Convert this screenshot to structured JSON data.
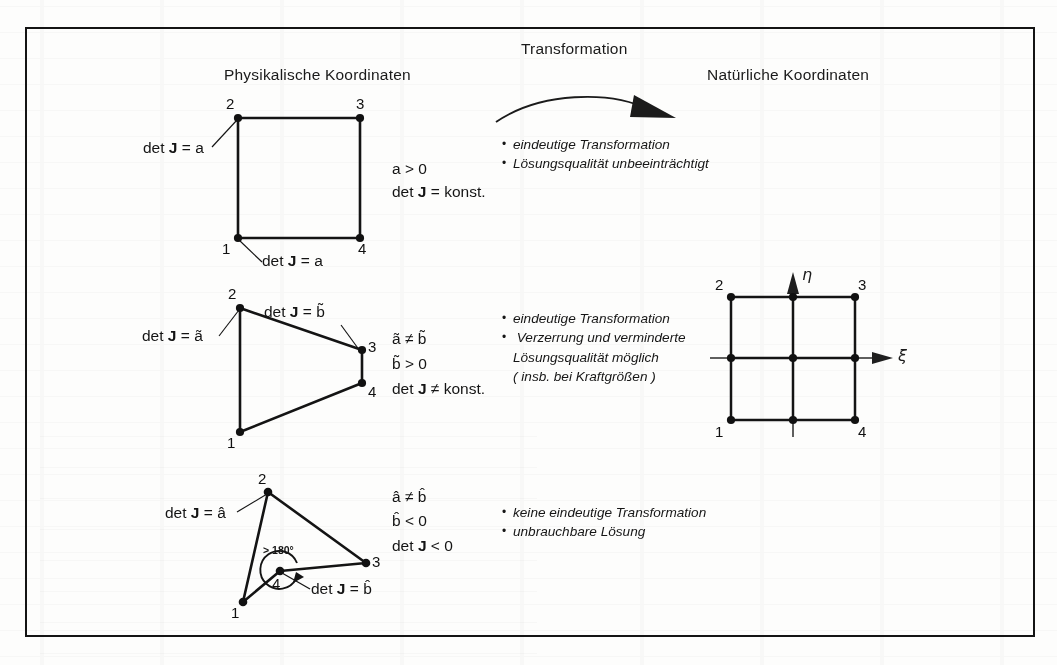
{
  "figure": {
    "headings": {
      "physical": "Physikalische Koordinaten",
      "transformation": "Transformation",
      "natural": "Natürliche Koordinaten"
    },
    "rows": [
      {
        "id": "square",
        "shape": "square",
        "node_labels": [
          "1",
          "2",
          "3",
          "4"
        ],
        "callouts": [
          {
            "text_prefix": "det ",
            "text_j": "J",
            "text_eq": " = a",
            "anchor": "node2"
          },
          {
            "text_prefix": "det ",
            "text_j": "J",
            "text_eq": " = a",
            "anchor": "node1"
          }
        ],
        "equations": [
          "a > 0",
          "det J = konst."
        ],
        "equation_parts": [
          {
            "lead": "a > 0",
            "j": "",
            "tail": ""
          },
          {
            "lead": "det ",
            "j": "J",
            "tail": " = konst."
          }
        ],
        "bullets": [
          "eindeutige Transformation",
          "Lösungsqualität unbeeinträchtigt"
        ]
      },
      {
        "id": "trapezoid",
        "shape": "trapezoid",
        "node_labels": [
          "1",
          "2",
          "3",
          "4"
        ],
        "callouts": [
          {
            "text_prefix": "det ",
            "text_j": "J",
            "text_eq": " = ã",
            "anchor": "node2"
          },
          {
            "text_prefix": "det ",
            "text_j": "J",
            "text_eq": " = b̃",
            "anchor": "node3"
          }
        ],
        "equations": [
          "ã ≠ b̃",
          "b̃ > 0",
          "det J ≠ konst."
        ],
        "bullets": [
          "eindeutige Transformation",
          "Verzerrung und verminderte",
          "Lösungsqualität möglich",
          "( insb. bei Kraftgrößen )"
        ]
      },
      {
        "id": "concave",
        "shape": "concave-quad",
        "node_labels": [
          "1",
          "2",
          "3",
          "4"
        ],
        "callouts": [
          {
            "text_prefix": "det ",
            "text_j": "J",
            "text_eq": " = â",
            "anchor": "node2"
          },
          {
            "text_prefix": "det ",
            "text_j": "J",
            "text_eq": " = b̂",
            "anchor": "node4"
          }
        ],
        "angle_label": "> 180°",
        "equations": [
          "â ≠ b̂",
          "b̂ < 0",
          "det J < 0"
        ],
        "bullets": [
          "keine eindeutige Transformation",
          "unbrauchbare Lösung"
        ]
      }
    ],
    "natural_element": {
      "node_labels": [
        "1",
        "2",
        "3",
        "4"
      ],
      "axis_x": "ξ",
      "axis_y": "η"
    },
    "symbols": {
      "det": "det",
      "jacobian": "J",
      "equals": "=",
      "not_equals": "≠",
      "greater": ">",
      "less": "<",
      "konst": "konst.",
      "a": "a",
      "b": "b",
      "zero": "0"
    },
    "colors": {
      "ink": "#141414",
      "paper": "#fdfdfc",
      "node": "#111111"
    }
  }
}
